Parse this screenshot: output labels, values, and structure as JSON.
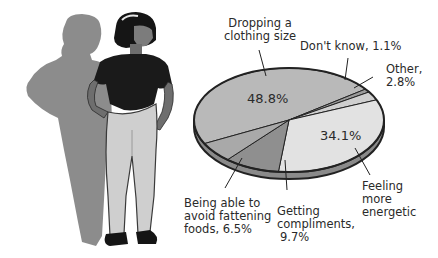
{
  "chart_data": {
    "type": "pie",
    "title": "",
    "style": "3d-tilted",
    "categories": [
      "Dropping a clothing size",
      "Don't know",
      "Other",
      "Feeling more energetic",
      "Getting compliments",
      "Being able to avoid fattening foods"
    ],
    "values": [
      48.8,
      1.1,
      2.8,
      34.1,
      9.7,
      6.5
    ],
    "colors": [
      "#b9b9b9",
      "#9a9a9a",
      "#cfcfcf",
      "#e2e2e2",
      "#8f8f8f",
      "#a9a9a9"
    ],
    "unit": "%",
    "legend": "none (callout labels)"
  },
  "labels": {
    "dropping_line1": "Dropping a",
    "dropping_line2": "clothing size",
    "dropping_pct": "48.8%",
    "dont_know": "Don't know, 1.1%",
    "other_line1": "Other,",
    "other_line2": "2.8%",
    "energetic_pct": "34.1%",
    "energetic_line1": "Feeling",
    "energetic_line2": "more",
    "energetic_line3": "energetic",
    "compliments_line1": "Getting",
    "compliments_line2": "compliments,",
    "compliments_line3": "9.7%",
    "avoid_line1": "Being able to",
    "avoid_line2": "avoid fattening",
    "avoid_line3": "foods, 6.5%"
  },
  "illustration": {
    "subject": "woman standing with hands on hips, larger shadow silhouette behind"
  }
}
